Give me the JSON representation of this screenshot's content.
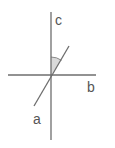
{
  "diagram": {
    "type": "intersecting-lines-angle",
    "colors": {
      "line": "#6e6e6e",
      "angle_fill": "#d9d9d9",
      "label": "#555555",
      "background": "#ffffff"
    },
    "lines": [
      {
        "id": "a",
        "label": "a",
        "x1": 34,
        "y1": 106,
        "x2": 69,
        "y2": 46
      },
      {
        "id": "b",
        "label": "b",
        "x1": 8,
        "y1": 75,
        "x2": 96,
        "y2": 75
      },
      {
        "id": "c",
        "label": "c",
        "x1": 51,
        "y1": 12,
        "x2": 51,
        "y2": 140
      }
    ],
    "labels": {
      "a": "a",
      "b": "b",
      "c": "c"
    },
    "marked_angle": {
      "between": [
        "c",
        "a"
      ],
      "vertex": [
        51,
        75
      ],
      "shaded": true
    }
  }
}
